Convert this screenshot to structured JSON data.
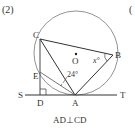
{
  "problem_label": "(2)",
  "next_problem_label": "(",
  "points": {
    "C": {
      "label": "C",
      "x": 40,
      "y": 39
    },
    "B": {
      "label": "B",
      "x": 113,
      "y": 55
    },
    "A": {
      "label": "A",
      "x": 75,
      "y": 95
    },
    "D": {
      "label": "D",
      "x": 40,
      "y": 95
    },
    "E": {
      "label": "E",
      "x": 40,
      "y": 72
    },
    "O": {
      "label": "O",
      "x": 76,
      "y": 53
    },
    "S": {
      "label": "S",
      "x": 22,
      "y": 95
    },
    "T": {
      "label": "T",
      "x": 121,
      "y": 95
    }
  },
  "circle": {
    "cx": 76,
    "cy": 53,
    "r": 42
  },
  "angles": {
    "x_label": "x°",
    "given_label": "24°"
  },
  "caption": "AD⊥CD",
  "colors": {
    "stroke": "#333333",
    "background": "#ffffff"
  }
}
